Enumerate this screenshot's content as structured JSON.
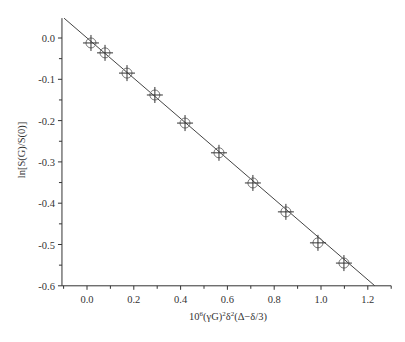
{
  "chart_data": {
    "type": "scatter",
    "title": "",
    "xlabel": "10^6(γG)^2δ^2(Δ−δ/3)",
    "ylabel": "ln[S(G)/S(0)]",
    "xlim": [
      -0.107,
      1.3
    ],
    "ylim": [
      -0.6,
      0.048
    ],
    "x_ticks": [
      0.0,
      0.2,
      0.4,
      0.6,
      0.8,
      1.0,
      1.2
    ],
    "x_tick_labels": [
      "0.0",
      "0.2",
      "0.4",
      "0.6",
      "0.8",
      "1.0",
      "1.2"
    ],
    "y_ticks": [
      0.0,
      -0.1,
      -0.2,
      -0.3,
      -0.4,
      -0.5,
      -0.6
    ],
    "y_tick_labels": [
      "0.0",
      "-0.1",
      "-0.2",
      "-0.3",
      "-0.4",
      "-0.5",
      "-0.6"
    ],
    "grid": false,
    "legend": null,
    "series": [
      {
        "name": "data",
        "marker": "circle-with-crosshair",
        "x": [
          0.017,
          0.077,
          0.171,
          0.29,
          0.419,
          0.564,
          0.709,
          0.85,
          0.987,
          1.098
        ],
        "y": [
          -0.012,
          -0.036,
          -0.085,
          -0.138,
          -0.206,
          -0.278,
          -0.351,
          -0.421,
          -0.496,
          -0.545
        ]
      },
      {
        "name": "linear fit",
        "type": "line",
        "x": [
          -0.098,
          1.23
        ],
        "y": [
          0.048,
          -0.6
        ]
      }
    ]
  },
  "axes": {
    "x_title_main": "10",
    "x_title_sup1": "6",
    "x_title_mid": "(γG)",
    "x_title_sup2": "2",
    "x_title_delta": "δ",
    "x_title_sup3": "2",
    "x_title_end": "(Δ−δ/3)",
    "y_title": "ln[S(G)/S(0)]"
  }
}
